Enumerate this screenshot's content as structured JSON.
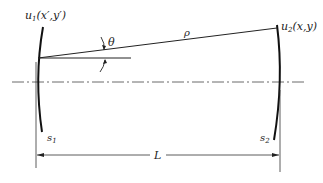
{
  "diagram": {
    "title": "",
    "labels": {
      "u1": "u",
      "u1_sub": "1",
      "u1_coords": "(x′,y′)",
      "u2": "u",
      "u2_sub": "2",
      "u2_coords": "(x,y)",
      "theta": "θ",
      "rho": "ρ",
      "s1": "s",
      "s1_sub": "1",
      "s2": "s",
      "s2_sub": "2",
      "L": "L"
    },
    "colors": {
      "line": "#222222",
      "background": "#ffffff"
    }
  }
}
